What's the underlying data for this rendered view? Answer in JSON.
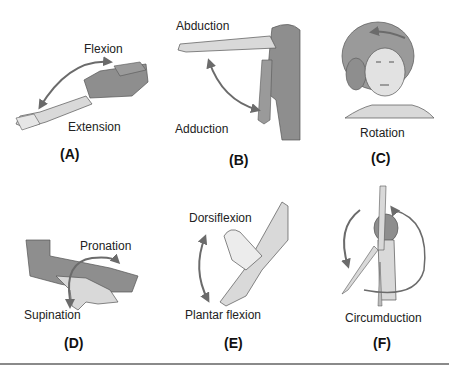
{
  "figure": {
    "colors": {
      "skin_light": "#d9d9d9",
      "skin_dark": "#8e8e8e",
      "outline": "#555555",
      "arrow": "#6b6b6b",
      "rule": "#8a8a8a"
    },
    "panels": [
      {
        "id": "(A)",
        "movement": "flexion-extension",
        "labels": [
          "Flexion",
          "Extension"
        ]
      },
      {
        "id": "(B)",
        "movement": "abduction-adduction",
        "labels": [
          "Abduction",
          "Adduction"
        ]
      },
      {
        "id": "(C)",
        "movement": "rotation",
        "labels": [
          "Rotation"
        ]
      },
      {
        "id": "(D)",
        "movement": "pronation-supination",
        "labels": [
          "Pronation",
          "Supination"
        ]
      },
      {
        "id": "(E)",
        "movement": "dorsiflexion-plantar-flexion",
        "labels": [
          "Dorsiflexion",
          "Plantar flexion"
        ]
      },
      {
        "id": "(F)",
        "movement": "circumduction",
        "labels": [
          "Circumduction"
        ]
      }
    ]
  }
}
